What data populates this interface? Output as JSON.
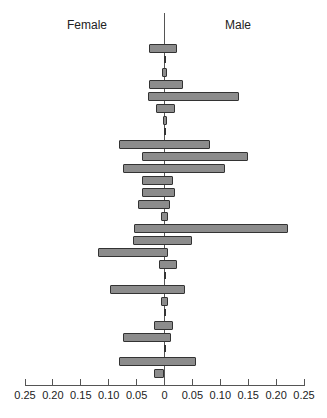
{
  "chart_data": {
    "type": "bar",
    "orientation": "horizontal-back-to-back",
    "title": "",
    "legend": [],
    "group_labels": {
      "left": "Female",
      "right": "Male"
    },
    "xlabel": "",
    "ylabel": "",
    "xlim": [
      -0.25,
      0.25
    ],
    "x_tick_labels": [
      "0.25",
      "0.20",
      "0.15",
      "0.10",
      "0.05",
      "0",
      "0.05",
      "0.10",
      "0.15",
      "0.20",
      "0.25"
    ],
    "x_ticks": [
      -0.25,
      -0.2,
      -0.15,
      -0.1,
      -0.05,
      0,
      0.05,
      0.1,
      0.15,
      0.2,
      0.25
    ],
    "grid": false,
    "categories": [
      "1",
      "2",
      "3",
      "4",
      "5",
      "6",
      "7",
      "8",
      "9",
      "10",
      "11",
      "12",
      "13",
      "14",
      "15",
      "16",
      "17",
      "18",
      "19",
      "20",
      "21",
      "22",
      "23",
      "24",
      "25",
      "26",
      "27",
      "28"
    ],
    "series": [
      {
        "name": "Female",
        "values": [
          0.027,
          0.0,
          0.005,
          0.027,
          0.029,
          0.016,
          0.003,
          0.0,
          0.081,
          0.041,
          0.074,
          0.041,
          0.041,
          0.047,
          0.007,
          0.054,
          0.056,
          0.119,
          0.009,
          0.0,
          0.097,
          0.007,
          0.0,
          0.018,
          0.075,
          0.0,
          0.081,
          0.018
        ]
      },
      {
        "name": "Male",
        "values": [
          0.023,
          0.0,
          0.005,
          0.034,
          0.134,
          0.018,
          0.005,
          0.0,
          0.081,
          0.149,
          0.108,
          0.016,
          0.018,
          0.009,
          0.007,
          0.222,
          0.05,
          0.007,
          0.022,
          0.0,
          0.036,
          0.007,
          0.0,
          0.016,
          0.011,
          0.0,
          0.056,
          0.0
        ]
      }
    ],
    "slivers": [
      2,
      8,
      20,
      23,
      26
    ]
  }
}
